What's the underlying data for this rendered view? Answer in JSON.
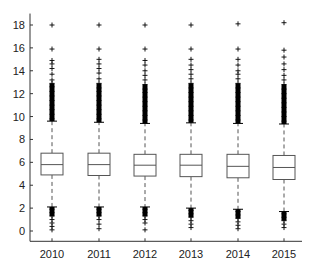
{
  "chart_data": {
    "type": "box",
    "title": "",
    "xlabel": "",
    "ylabel": "",
    "ylim": [
      -0.9,
      19
    ],
    "yticks": [
      0,
      2,
      4,
      6,
      8,
      10,
      12,
      14,
      16,
      18
    ],
    "grid": false,
    "legend": null,
    "categories": [
      "2010",
      "2011",
      "2012",
      "2013",
      "2014",
      "2015"
    ],
    "boxes": [
      {
        "category": "2010",
        "whisker_low": 2.1,
        "q1": 4.9,
        "median": 5.8,
        "q3": 6.8,
        "whisker_high": 9.6,
        "outliers_high": [
          9.8,
          10.2,
          10.6,
          11.0,
          11.4,
          11.8,
          12.2,
          12.6,
          12.9,
          13.2,
          13.7,
          14.2,
          14.6,
          14.9,
          15.9,
          18.0
        ],
        "outliers_low": [
          1.9,
          1.6,
          1.3,
          1.0,
          0.7,
          0.4,
          0.1
        ]
      },
      {
        "category": "2011",
        "whisker_low": 2.1,
        "q1": 4.85,
        "median": 5.8,
        "q3": 6.8,
        "whisker_high": 9.5,
        "outliers_high": [
          9.8,
          10.2,
          10.6,
          11.0,
          11.4,
          11.8,
          12.2,
          12.5,
          12.9,
          13.3,
          13.8,
          14.2,
          14.6,
          15.0,
          15.9,
          18.0
        ],
        "outliers_low": [
          1.9,
          1.6,
          1.3,
          1.0,
          0.6,
          0.2
        ]
      },
      {
        "category": "2012",
        "whisker_low": 2.1,
        "q1": 4.8,
        "median": 5.75,
        "q3": 6.7,
        "whisker_high": 9.4,
        "outliers_high": [
          9.7,
          10.1,
          10.5,
          10.9,
          11.3,
          11.7,
          12.1,
          12.4,
          12.8,
          13.2,
          13.6,
          14.0,
          14.5,
          14.9,
          15.9,
          18.0
        ],
        "outliers_low": [
          1.9,
          1.6,
          1.3,
          1.0,
          0.7,
          0.1
        ]
      },
      {
        "category": "2013",
        "whisker_low": 2.0,
        "q1": 4.75,
        "median": 5.75,
        "q3": 6.7,
        "whisker_high": 9.45,
        "outliers_high": [
          9.7,
          10.1,
          10.5,
          10.9,
          11.3,
          11.7,
          12.1,
          12.5,
          12.9,
          13.3,
          13.7,
          14.1,
          14.5,
          15.0,
          15.9,
          18.0
        ],
        "outliers_low": [
          1.8,
          1.5,
          1.2,
          0.9,
          0.6,
          0.3
        ]
      },
      {
        "category": "2014",
        "whisker_low": 1.9,
        "q1": 4.65,
        "median": 5.65,
        "q3": 6.7,
        "whisker_high": 9.4,
        "outliers_high": [
          9.7,
          10.1,
          10.5,
          10.9,
          11.3,
          11.7,
          12.1,
          12.5,
          12.9,
          13.3,
          13.7,
          14.0,
          14.5,
          15.0,
          15.9,
          18.1
        ],
        "outliers_low": [
          1.7,
          1.4,
          1.1,
          0.8,
          0.5,
          0.2
        ]
      },
      {
        "category": "2015",
        "whisker_low": 1.7,
        "q1": 4.5,
        "median": 5.55,
        "q3": 6.6,
        "whisker_high": 9.35,
        "outliers_high": [
          9.6,
          10.0,
          10.4,
          10.8,
          11.2,
          11.6,
          12.0,
          12.4,
          12.8,
          13.2,
          13.6,
          14.1,
          14.6,
          15.2,
          15.8,
          18.2
        ],
        "outliers_low": [
          1.5,
          1.2,
          0.9,
          0.6,
          0.3
        ]
      }
    ],
    "colors": {
      "box": "#555555",
      "whisker": "#555555",
      "outlier": "#000000",
      "axis": "#333333"
    }
  }
}
